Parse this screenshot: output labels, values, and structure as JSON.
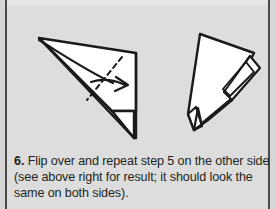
{
  "page": {
    "background_color": "#dddddd",
    "rule_color": "#4a4a4a",
    "ink_color": "#1a1a1a",
    "paper_fill": "#ffffff"
  },
  "caption": {
    "step_number": "6.",
    "line1_rest": " Flip over and repeat step 5 on the other side",
    "line2": "(see above right for result; it should look the",
    "line3": "same on both sides).",
    "full_text": "6. Flip over and repeat step 5 on the other side (see above right for result; it should look the same on both sides)."
  },
  "figures": [
    {
      "name": "before-fold-diagram",
      "position": "left",
      "description": "Folded triangular paper seen from the side with a dashed valley-fold line and a curved arrow pointing right",
      "has_dashed_fold_line": true,
      "has_fold_arrow": true,
      "arrow_direction": "right"
    },
    {
      "name": "after-fold-diagram",
      "position": "right",
      "description": "Resulting narrow triangular shape with layered flaps along the right edge and a notch at the bottom",
      "has_dashed_fold_line": false,
      "has_fold_arrow": false
    }
  ]
}
